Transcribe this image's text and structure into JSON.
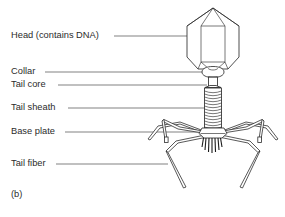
{
  "figure": {
    "caption": "(b)"
  },
  "labels": [
    {
      "id": "head",
      "text": "Head (contains DNA)",
      "name": "label-head",
      "x": 11,
      "y": 31,
      "leader": {
        "x1": 114,
        "y1": 36,
        "x2": 193,
        "y2": 36
      }
    },
    {
      "id": "collar",
      "text": "Collar",
      "name": "label-collar",
      "x": 11,
      "y": 67,
      "leader": {
        "x1": 45,
        "y1": 72,
        "x2": 207,
        "y2": 72
      }
    },
    {
      "id": "tail_core",
      "text": "Tail core",
      "name": "label-tail-core",
      "x": 11,
      "y": 80,
      "leader": {
        "x1": 58,
        "y1": 85,
        "x2": 207,
        "y2": 85
      }
    },
    {
      "id": "tail_sheath",
      "text": "Tail sheath",
      "name": "label-tail-sheath",
      "x": 11,
      "y": 103,
      "leader": {
        "x1": 68,
        "y1": 108,
        "x2": 210,
        "y2": 108
      }
    },
    {
      "id": "base_plate",
      "text": "Base plate",
      "name": "label-base-plate",
      "x": 11,
      "y": 127,
      "leader": {
        "x1": 65,
        "y1": 132,
        "x2": 203,
        "y2": 132
      }
    },
    {
      "id": "tail_fiber",
      "text": "Tail fiber",
      "name": "label-tail-fiber",
      "x": 11,
      "y": 159,
      "leader": {
        "x1": 56,
        "y1": 164,
        "x2": 168,
        "y2": 164
      }
    }
  ],
  "colors": {
    "background": "#ffffff",
    "outline": "#2e2e2e",
    "leader_line": "#4a4a4a",
    "text": "#2b2b2b"
  }
}
